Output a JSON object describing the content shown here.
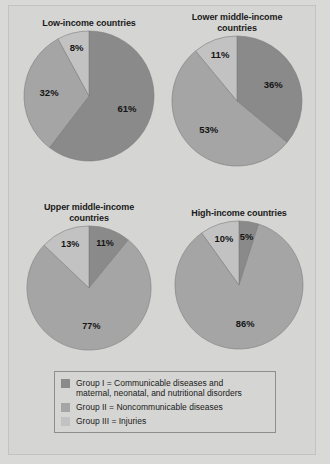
{
  "figure": {
    "background_color": "#d5d5d3",
    "border_color": "#c3c3c1"
  },
  "colors": {
    "group_i": "#8a8a8a",
    "group_ii": "#a5a5a5",
    "group_iii": "#c2c2c2",
    "slice_outline": "#7c7c7c"
  },
  "legend": {
    "items": [
      {
        "swatch": "group-i-swatch",
        "color": "#8a8a8a",
        "line1": "Group I = Communicable diseases and",
        "line2": "maternal, neonatal, and nutritional disorders"
      },
      {
        "swatch": "group-ii-swatch",
        "color": "#a5a5a5",
        "line1": "Group II = Noncommunicable diseases",
        "line2": ""
      },
      {
        "swatch": "group-iii-swatch",
        "color": "#c2c2c2",
        "line1": "Group III = Injuries",
        "line2": ""
      }
    ]
  },
  "chart_data": [
    {
      "type": "pie",
      "title": "Low-income countries",
      "title_line1": "Low-income countries",
      "title_line2": "",
      "categories": [
        "Group I",
        "Group II",
        "Group III"
      ],
      "values": [
        61,
        32,
        8
      ],
      "labels": [
        "61%",
        "32%",
        "8%"
      ],
      "colors": [
        "#8a8a8a",
        "#a5a5a5",
        "#c2c2c2"
      ],
      "start_angle_deg": 0,
      "direction": "clockwise",
      "legend": "shared"
    },
    {
      "type": "pie",
      "title": "Lower middle-income countries",
      "title_line1": "Lower middle-income",
      "title_line2": "countries",
      "categories": [
        "Group I",
        "Group II",
        "Group III"
      ],
      "values": [
        36,
        53,
        11
      ],
      "labels": [
        "36%",
        "53%",
        "11%"
      ],
      "colors": [
        "#8a8a8a",
        "#a5a5a5",
        "#c2c2c2"
      ],
      "start_angle_deg": 0,
      "direction": "clockwise",
      "legend": "shared"
    },
    {
      "type": "pie",
      "title": "Upper middle-income countries",
      "title_line1": "Upper middle-income",
      "title_line2": "countries",
      "categories": [
        "Group I",
        "Group II",
        "Group III"
      ],
      "values": [
        11,
        77,
        13
      ],
      "labels": [
        "11%",
        "77%",
        "13%"
      ],
      "colors": [
        "#8a8a8a",
        "#a5a5a5",
        "#c2c2c2"
      ],
      "start_angle_deg": 0,
      "direction": "clockwise",
      "legend": "shared"
    },
    {
      "type": "pie",
      "title": "High-income countries",
      "title_line1": "High-income countries",
      "title_line2": "",
      "categories": [
        "Group I",
        "Group II",
        "Group III"
      ],
      "values": [
        5,
        86,
        10
      ],
      "labels": [
        "5%",
        "86%",
        "10%"
      ],
      "colors": [
        "#8a8a8a",
        "#a5a5a5",
        "#c2c2c2"
      ],
      "start_angle_deg": 0,
      "direction": "clockwise",
      "legend": "shared"
    }
  ]
}
